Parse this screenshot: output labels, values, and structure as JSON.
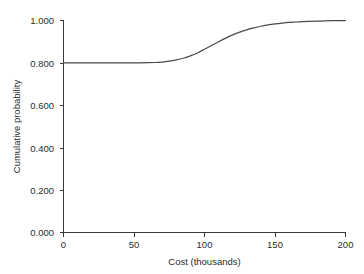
{
  "chart_data": {
    "type": "line",
    "title": "",
    "subtitle": "",
    "xlabel": "Cost (thousands)",
    "ylabel": "Cumulative probability",
    "xlim": [
      0,
      200
    ],
    "ylim": [
      0.0,
      1.0
    ],
    "xticks": [
      0,
      50,
      100,
      150,
      200
    ],
    "xtick_labels": [
      "0",
      "50",
      "100",
      "150",
      "200"
    ],
    "yticks": [
      0.0,
      0.2,
      0.4,
      0.6,
      0.8,
      1.0
    ],
    "ytick_labels": [
      "0.000",
      "0.200",
      "0.400",
      "0.600",
      "0.800",
      "1.000"
    ],
    "grid": false,
    "legend": null,
    "annotations": [],
    "series": [
      {
        "name": "Cumulative probability of cost",
        "color": "#4a4a4a",
        "x": [
          0,
          10,
          20,
          30,
          40,
          50,
          60,
          65,
          70,
          75,
          80,
          85,
          90,
          95,
          100,
          105,
          110,
          115,
          120,
          125,
          130,
          135,
          140,
          145,
          150,
          155,
          160,
          165,
          170,
          175,
          180,
          185,
          190,
          195,
          200
        ],
        "y": [
          0.8,
          0.8,
          0.8,
          0.8,
          0.8,
          0.8,
          0.801,
          0.802,
          0.804,
          0.808,
          0.814,
          0.822,
          0.833,
          0.847,
          0.864,
          0.882,
          0.9,
          0.917,
          0.932,
          0.945,
          0.956,
          0.965,
          0.973,
          0.979,
          0.984,
          0.988,
          0.991,
          0.993,
          0.995,
          0.996,
          0.997,
          0.998,
          0.999,
          0.999,
          1.0
        ]
      }
    ]
  },
  "axes": {
    "y_axis_name": "cumulative-probability-axis",
    "x_axis_name": "cost-axis"
  }
}
